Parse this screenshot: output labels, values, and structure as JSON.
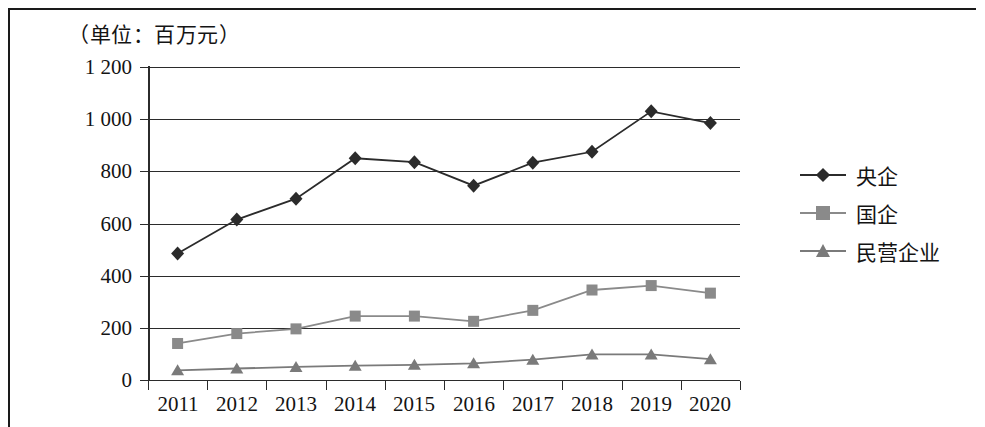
{
  "unit_caption": "（单位：百万元）",
  "chart_data": {
    "type": "line",
    "title": "",
    "subtitle": "",
    "xlabel": "",
    "ylabel": "",
    "unit_note": "（单位：百万元）",
    "grid": true,
    "legend_position": "right",
    "categories": [
      "2011",
      "2012",
      "2013",
      "2014",
      "2015",
      "2016",
      "2017",
      "2018",
      "2019",
      "2020"
    ],
    "ylim": [
      0,
      1200
    ],
    "yticks": [
      0,
      200,
      400,
      600,
      800,
      1000,
      1200
    ],
    "ytick_labels": [
      "0",
      "200",
      "400",
      "600",
      "800",
      "1 000",
      "1 200"
    ],
    "series": [
      {
        "name": "央企",
        "marker": "diamond",
        "color": "#2b2b2b",
        "values": [
          485,
          615,
          695,
          850,
          835,
          745,
          833,
          875,
          1030,
          985
        ]
      },
      {
        "name": "国企",
        "marker": "square",
        "color": "#8a8a8a",
        "values": [
          140,
          178,
          196,
          245,
          245,
          225,
          267,
          345,
          362,
          333
        ]
      },
      {
        "name": "民营企业",
        "marker": "triangle",
        "color": "#7a7a7a",
        "values": [
          37,
          44,
          50,
          55,
          58,
          64,
          78,
          98,
          98,
          80
        ]
      }
    ]
  },
  "legend": {
    "items": [
      {
        "label": "央企",
        "marker": "diamond",
        "color": "#2b2b2b"
      },
      {
        "label": "国企",
        "marker": "square",
        "color": "#8a8a8a"
      },
      {
        "label": "民营企业",
        "marker": "triangle",
        "color": "#7a7a7a"
      }
    ]
  }
}
